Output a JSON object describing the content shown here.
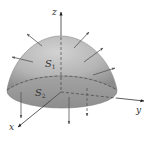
{
  "figure": {
    "axes": {
      "z_label": "z",
      "y_label": "y",
      "x_label": "x"
    },
    "surfaces": {
      "s1": {
        "letter": "S",
        "subscript": "1"
      },
      "s2": {
        "letter": "S",
        "subscript": "2"
      }
    },
    "colors": {
      "surface_top": "#c8c8c8",
      "surface_mid": "#a9a9a9",
      "surface_edge": "#8a8a8a",
      "base_disk": "#9a9a9a",
      "axis": "#333333",
      "arrow": "#555555",
      "dashed": "#3a3a3a"
    }
  }
}
